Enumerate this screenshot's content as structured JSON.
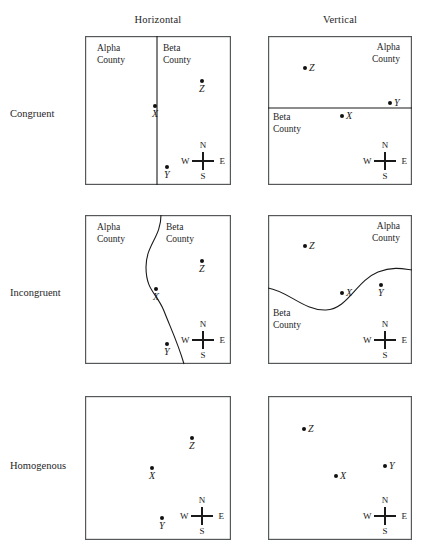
{
  "figure": {
    "width": 422,
    "height": 554,
    "border_color": "#55595c",
    "line_color": "#1a1a1a",
    "point_color": "#111111"
  },
  "columns": [
    {
      "id": "horizontal",
      "label": "Horizontal",
      "x": 158,
      "y": 14
    },
    {
      "id": "vertical",
      "label": "Vertical",
      "x": 340,
      "y": 14
    }
  ],
  "rows": [
    {
      "id": "congruent",
      "label": "Congruent",
      "x": 10,
      "y": 108
    },
    {
      "id": "incongruent",
      "label": "Incongruent",
      "x": 10,
      "y": 287
    },
    {
      "id": "homogenous",
      "label": "Homogenous",
      "x": 10,
      "y": 460
    }
  ],
  "compass": {
    "north": "N",
    "south": "S",
    "east": "E",
    "west": "W"
  },
  "county_names": {
    "alpha_line1": "Alpha",
    "alpha_line2": "County",
    "beta_line1": "Beta",
    "beta_line2": "County"
  },
  "panels": [
    {
      "id": "congruent-horizontal",
      "row": "congruent",
      "column": "horizontal",
      "box": {
        "x": 85,
        "y": 36,
        "w": 146,
        "h": 149
      },
      "divider": {
        "type": "vertical-straight",
        "x": 72
      },
      "counties": [
        {
          "name": "Alpha County",
          "line1": "Alpha",
          "line2": "County",
          "x": 12,
          "y": 7,
          "align": "left"
        },
        {
          "name": "Beta County",
          "line1": "Beta",
          "line2": "County",
          "x": 78,
          "y": 7,
          "align": "left"
        }
      ],
      "points": [
        {
          "label": "Z",
          "x": 117,
          "y": 45,
          "label_pos": "below"
        },
        {
          "label": "X",
          "x": 70,
          "y": 70,
          "label_pos": "below"
        },
        {
          "label": "Y",
          "x": 82,
          "y": 131,
          "label_pos": "below"
        }
      ],
      "compass_pos": {
        "x": 96,
        "y": 105
      }
    },
    {
      "id": "congruent-vertical",
      "row": "congruent",
      "column": "vertical",
      "box": {
        "x": 268,
        "y": 36,
        "w": 144,
        "h": 149
      },
      "divider": {
        "type": "horizontal-straight",
        "y": 72
      },
      "counties": [
        {
          "name": "Alpha County",
          "line1": "Alpha",
          "line2": "County",
          "x": 104,
          "y": 6,
          "align": "right"
        },
        {
          "name": "Beta County",
          "line1": "Beta",
          "line2": "County",
          "x": 5,
          "y": 76,
          "align": "left"
        }
      ],
      "points": [
        {
          "label": "Z",
          "x": 37,
          "y": 32,
          "label_pos": "right"
        },
        {
          "label": "Y",
          "x": 122,
          "y": 67,
          "label_pos": "right"
        },
        {
          "label": "X",
          "x": 74,
          "y": 80,
          "label_pos": "right"
        }
      ],
      "compass_pos": {
        "x": 95,
        "y": 105
      }
    },
    {
      "id": "incongruent-horizontal",
      "row": "incongruent",
      "column": "horizontal",
      "box": {
        "x": 85,
        "y": 215,
        "w": 146,
        "h": 149
      },
      "divider": {
        "type": "vertical-curve",
        "path": "M 76 0 C 76 22, 61 30, 61 52 C 61 76, 72 78, 79 96 C 86 114, 93 128, 99 149"
      },
      "counties": [
        {
          "name": "Alpha County",
          "line1": "Alpha",
          "line2": "County",
          "x": 12,
          "y": 7,
          "align": "left"
        },
        {
          "name": "Beta County",
          "line1": "Beta",
          "line2": "County",
          "x": 81,
          "y": 7,
          "align": "left"
        }
      ],
      "points": [
        {
          "label": "Z",
          "x": 117,
          "y": 46,
          "label_pos": "below"
        },
        {
          "label": "X",
          "x": 71,
          "y": 74,
          "label_pos": "below"
        },
        {
          "label": "Y",
          "x": 82,
          "y": 129,
          "label_pos": "below"
        }
      ],
      "compass_pos": {
        "x": 96,
        "y": 105
      }
    },
    {
      "id": "incongruent-vertical",
      "row": "incongruent",
      "column": "vertical",
      "box": {
        "x": 268,
        "y": 215,
        "w": 144,
        "h": 149
      },
      "divider": {
        "type": "horizontal-curve",
        "path": "M 0 73 C 20 76, 36 96, 58 95 C 80 94, 88 66, 110 57 C 126 51, 136 54, 144 55"
      },
      "counties": [
        {
          "name": "Alpha County",
          "line1": "Alpha",
          "line2": "County",
          "x": 104,
          "y": 6,
          "align": "right"
        },
        {
          "name": "Beta County",
          "line1": "Beta",
          "line2": "County",
          "x": 5,
          "y": 93,
          "align": "left"
        }
      ],
      "points": [
        {
          "label": "Z",
          "x": 37,
          "y": 31,
          "label_pos": "right"
        },
        {
          "label": "Y",
          "x": 113,
          "y": 70,
          "label_pos": "below"
        },
        {
          "label": "X",
          "x": 74,
          "y": 78,
          "label_pos": "right"
        }
      ],
      "compass_pos": {
        "x": 95,
        "y": 105
      }
    },
    {
      "id": "homogenous-horizontal",
      "row": "homogenous",
      "column": "horizontal",
      "box": {
        "x": 85,
        "y": 396,
        "w": 146,
        "h": 144
      },
      "divider": {
        "type": "none"
      },
      "counties": [],
      "points": [
        {
          "label": "Z",
          "x": 107,
          "y": 42,
          "label_pos": "below"
        },
        {
          "label": "X",
          "x": 67,
          "y": 72,
          "label_pos": "below"
        },
        {
          "label": "Y",
          "x": 77,
          "y": 122,
          "label_pos": "below"
        }
      ],
      "compass_pos": {
        "x": 95,
        "y": 100
      }
    },
    {
      "id": "homogenous-vertical",
      "row": "homogenous",
      "column": "vertical",
      "box": {
        "x": 268,
        "y": 396,
        "w": 144,
        "h": 144
      },
      "divider": {
        "type": "none"
      },
      "counties": [],
      "points": [
        {
          "label": "Z",
          "x": 36,
          "y": 33,
          "label_pos": "right"
        },
        {
          "label": "Y",
          "x": 117,
          "y": 70,
          "label_pos": "right"
        },
        {
          "label": "X",
          "x": 68,
          "y": 80,
          "label_pos": "right"
        }
      ],
      "compass_pos": {
        "x": 95,
        "y": 100
      }
    }
  ]
}
